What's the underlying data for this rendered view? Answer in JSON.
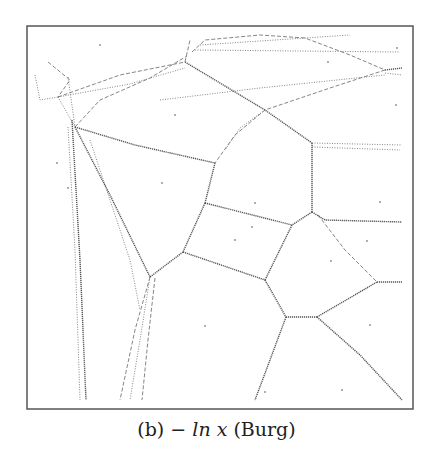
{
  "figure": {
    "frame": {
      "x": 27,
      "y": 26,
      "width": 386,
      "height": 383,
      "stroke": "#555555"
    },
    "edge_color": "#777777",
    "strong_edge_color": "#555555",
    "site_color": "#888888"
  },
  "caption": {
    "label": "(b)",
    "math": "− ln x",
    "name": "(Burg)"
  },
  "diagram_data": {
    "type": "voronoi",
    "divergence": "−ln x (Burg)",
    "sites": [
      [
        100,
        45
      ],
      [
        175,
        115
      ],
      [
        328,
        62
      ],
      [
        397,
        48
      ],
      [
        396,
        105
      ],
      [
        162,
        183
      ],
      [
        68,
        188
      ],
      [
        57,
        163
      ],
      [
        255,
        203
      ],
      [
        380,
        202
      ],
      [
        235,
        240
      ],
      [
        252,
        227
      ],
      [
        331,
        261
      ],
      [
        367,
        241
      ],
      [
        205,
        326
      ],
      [
        265,
        392
      ],
      [
        370,
        325
      ],
      [
        342,
        390
      ]
    ],
    "edges": [
      {
        "points": [
          [
            35,
            75
          ],
          [
            40,
            100
          ],
          [
            58,
            97
          ]
        ],
        "style": "dot"
      },
      {
        "points": [
          [
            48,
            62
          ],
          [
            70,
            80
          ],
          [
            58,
            97
          ]
        ],
        "style": "dash"
      },
      {
        "points": [
          [
            58,
            97
          ],
          [
            120,
            75
          ],
          [
            185,
            62
          ]
        ],
        "style": "dash"
      },
      {
        "points": [
          [
            58,
            97
          ],
          [
            130,
            84
          ],
          [
            185,
            68
          ]
        ],
        "style": "dot"
      },
      {
        "points": [
          [
            75,
            127
          ],
          [
            100,
            100
          ],
          [
            150,
            78
          ],
          [
            187,
            56
          ]
        ],
        "style": "dash"
      },
      {
        "points": [
          [
            58,
            97
          ],
          [
            75,
            127
          ]
        ],
        "style": "dot"
      },
      {
        "points": [
          [
            68,
            77
          ],
          [
            75,
            127
          ]
        ],
        "style": "dot"
      },
      {
        "points": [
          [
            185,
            62
          ],
          [
            190,
            40
          ]
        ],
        "style": "dash"
      },
      {
        "points": [
          [
            192,
            52
          ],
          [
            205,
            40
          ],
          [
            260,
            35
          ],
          [
            305,
            38
          ],
          [
            350,
            55
          ],
          [
            385,
            70
          ]
        ],
        "style": "dash"
      },
      {
        "points": [
          [
            200,
            45
          ],
          [
            350,
            35
          ]
        ],
        "style": "dot"
      },
      {
        "points": [
          [
            195,
            50
          ],
          [
            400,
            52
          ]
        ],
        "style": "dot"
      },
      {
        "points": [
          [
            185,
            62
          ],
          [
            265,
            110
          ],
          [
            312,
            143
          ]
        ],
        "style": "solid"
      },
      {
        "points": [
          [
            385,
            70
          ],
          [
            402,
            68
          ]
        ],
        "style": "solid"
      },
      {
        "points": [
          [
            385,
            73
          ],
          [
            402,
            75
          ]
        ],
        "style": "dot"
      },
      {
        "points": [
          [
            385,
            70
          ],
          [
            330,
            88
          ],
          [
            265,
            110
          ],
          [
            235,
            135
          ],
          [
            215,
            163
          ]
        ],
        "style": "dash"
      },
      {
        "points": [
          [
            160,
            100
          ],
          [
            260,
            88
          ],
          [
            385,
            75
          ]
        ],
        "style": "dot"
      },
      {
        "points": [
          [
            265,
            110
          ],
          [
            240,
            128
          ],
          [
            225,
            150
          ]
        ],
        "style": "dot"
      },
      {
        "points": [
          [
            312,
            143
          ],
          [
            402,
            145
          ]
        ],
        "style": "dot"
      },
      {
        "points": [
          [
            312,
            147
          ],
          [
            400,
            150
          ]
        ],
        "style": "dot"
      },
      {
        "points": [
          [
            75,
            127
          ],
          [
            135,
            145
          ],
          [
            215,
            163
          ]
        ],
        "style": "solid"
      },
      {
        "points": [
          [
            215,
            163
          ],
          [
            205,
            203
          ]
        ],
        "style": "solid"
      },
      {
        "points": [
          [
            312,
            143
          ],
          [
            312,
            212
          ]
        ],
        "style": "solid"
      },
      {
        "points": [
          [
            205,
            203
          ],
          [
            292,
            225
          ]
        ],
        "style": "solid"
      },
      {
        "points": [
          [
            312,
            212
          ],
          [
            292,
            225
          ]
        ],
        "style": "solid"
      },
      {
        "points": [
          [
            312,
            212
          ],
          [
            325,
            220
          ],
          [
            402,
            222
          ]
        ],
        "style": "solid"
      },
      {
        "points": [
          [
            318,
            215
          ],
          [
            345,
            250
          ],
          [
            377,
            282
          ]
        ],
        "style": "dash"
      },
      {
        "points": [
          [
            205,
            203
          ],
          [
            183,
            252
          ]
        ],
        "style": "solid"
      },
      {
        "points": [
          [
            292,
            225
          ],
          [
            265,
            280
          ]
        ],
        "style": "solid"
      },
      {
        "points": [
          [
            183,
            252
          ],
          [
            265,
            280
          ]
        ],
        "style": "solid"
      },
      {
        "points": [
          [
            183,
            252
          ],
          [
            150,
            277
          ]
        ],
        "style": "solid"
      },
      {
        "points": [
          [
            75,
            127
          ],
          [
            110,
            195
          ],
          [
            150,
            277
          ]
        ],
        "style": "solid"
      },
      {
        "points": [
          [
            90,
            140
          ],
          [
            130,
            260
          ],
          [
            140,
            310
          ]
        ],
        "style": "dot"
      },
      {
        "points": [
          [
            150,
            277
          ],
          [
            135,
            330
          ],
          [
            120,
            400
          ]
        ],
        "style": "dash"
      },
      {
        "points": [
          [
            150,
            277
          ],
          [
            140,
            340
          ],
          [
            130,
            400
          ]
        ],
        "style": "dot"
      },
      {
        "points": [
          [
            155,
            278
          ],
          [
            148,
            340
          ],
          [
            142,
            400
          ]
        ],
        "style": "dash"
      },
      {
        "points": [
          [
            68,
            127
          ],
          [
            75,
            250
          ],
          [
            80,
            400
          ]
        ],
        "style": "dot"
      },
      {
        "points": [
          [
            72,
            120
          ],
          [
            80,
            260
          ],
          [
            86,
            400
          ]
        ],
        "style": "solid"
      },
      {
        "points": [
          [
            265,
            280
          ],
          [
            286,
            317
          ]
        ],
        "style": "solid"
      },
      {
        "points": [
          [
            286,
            317
          ],
          [
            317,
            317
          ]
        ],
        "style": "solid"
      },
      {
        "points": [
          [
            317,
            317
          ],
          [
            377,
            282
          ]
        ],
        "style": "solid"
      },
      {
        "points": [
          [
            377,
            282
          ],
          [
            402,
            282
          ]
        ],
        "style": "solid"
      },
      {
        "points": [
          [
            286,
            317
          ],
          [
            270,
            360
          ],
          [
            255,
            400
          ]
        ],
        "style": "solid"
      },
      {
        "points": [
          [
            317,
            317
          ],
          [
            360,
            355
          ],
          [
            402,
            400
          ]
        ],
        "style": "solid"
      }
    ]
  }
}
